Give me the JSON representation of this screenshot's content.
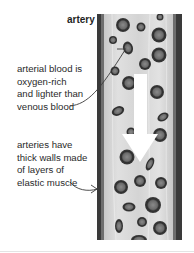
{
  "diagram": {
    "title": "artery",
    "annotations": [
      {
        "id": "oxygen-rich",
        "lines": [
          "arterial blood is",
          "oxygen-rich",
          "and lighter than",
          "venous blood"
        ]
      },
      {
        "id": "walls",
        "lines": [
          "arteries have",
          "thick walls made",
          "of layers of",
          "elastic muscle"
        ]
      }
    ],
    "flow_direction": "down",
    "colors": {
      "wall_dark": "#3a3a3a",
      "wall_mid": "#6e6e6e",
      "lumen": "#d6d6d6",
      "cell_ring": "#3c3c3c",
      "cell_core": "#7a7a7a",
      "arrow": "#ffffff",
      "text": "#2a2a2a"
    }
  }
}
